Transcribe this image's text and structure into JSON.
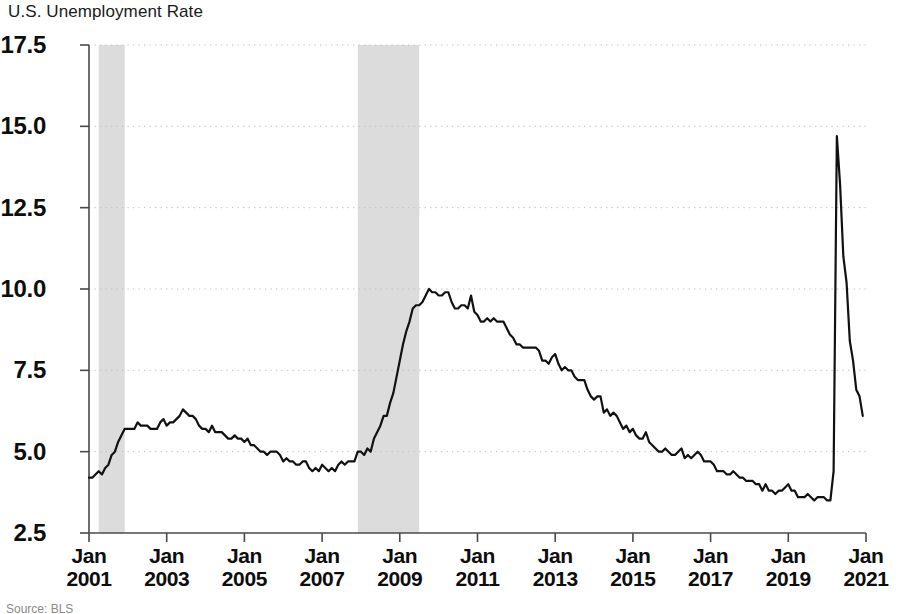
{
  "chart_data": {
    "type": "line",
    "title": "U.S. Unemployment Rate",
    "xlabel": "",
    "ylabel": "",
    "ylim": [
      2.5,
      17.5
    ],
    "yticks": [
      "2.5",
      "5.0",
      "7.5",
      "10.0",
      "12.5",
      "15.0",
      "17.5"
    ],
    "ytick_values": [
      2.5,
      5.0,
      7.5,
      10.0,
      12.5,
      15.0,
      17.5
    ],
    "xticks": [
      {
        "month": "Jan",
        "year": "2001"
      },
      {
        "month": "Jan",
        "year": "2003"
      },
      {
        "month": "Jan",
        "year": "2005"
      },
      {
        "month": "Jan",
        "year": "2007"
      },
      {
        "month": "Jan",
        "year": "2009"
      },
      {
        "month": "Jan",
        "year": "2011"
      },
      {
        "month": "Jan",
        "year": "2013"
      },
      {
        "month": "Jan",
        "year": "2015"
      },
      {
        "month": "Jan",
        "year": "2017"
      },
      {
        "month": "Jan",
        "year": "2019"
      },
      {
        "month": "Jan",
        "year": "2021"
      }
    ],
    "xtick_values": [
      2001,
      2003,
      2005,
      2007,
      2009,
      2011,
      2013,
      2015,
      2017,
      2019,
      2021
    ],
    "xlim": [
      2001.0,
      2021.0
    ],
    "grid": true,
    "grid_style": "dotted-horizontal",
    "legend": null,
    "line_color": "#111111",
    "line_width": 2.2,
    "shaded_regions": [
      {
        "label": "recession",
        "x0": 2001.25,
        "x1": 2001.92,
        "color": "#dcdcdc"
      },
      {
        "label": "recession",
        "x0": 2007.92,
        "x1": 2009.5,
        "color": "#dcdcdc"
      }
    ],
    "x_start": 2001.0,
    "x_step": 0.0833333,
    "values": [
      4.2,
      4.2,
      4.3,
      4.4,
      4.3,
      4.5,
      4.6,
      4.9,
      5.0,
      5.3,
      5.5,
      5.7,
      5.7,
      5.7,
      5.7,
      5.9,
      5.8,
      5.8,
      5.8,
      5.7,
      5.7,
      5.7,
      5.9,
      6.0,
      5.8,
      5.9,
      5.9,
      6.0,
      6.1,
      6.3,
      6.2,
      6.1,
      6.1,
      6.0,
      5.8,
      5.7,
      5.7,
      5.6,
      5.8,
      5.6,
      5.6,
      5.6,
      5.5,
      5.4,
      5.4,
      5.5,
      5.4,
      5.4,
      5.3,
      5.4,
      5.2,
      5.2,
      5.1,
      5.0,
      5.0,
      4.9,
      5.0,
      5.0,
      5.0,
      4.9,
      4.7,
      4.8,
      4.7,
      4.7,
      4.6,
      4.6,
      4.7,
      4.7,
      4.5,
      4.4,
      4.5,
      4.4,
      4.6,
      4.5,
      4.4,
      4.5,
      4.4,
      4.6,
      4.7,
      4.6,
      4.7,
      4.7,
      4.7,
      5.0,
      5.0,
      4.9,
      5.1,
      5.0,
      5.4,
      5.6,
      5.8,
      6.1,
      6.1,
      6.5,
      6.8,
      7.3,
      7.8,
      8.3,
      8.7,
      9.0,
      9.4,
      9.5,
      9.5,
      9.6,
      9.8,
      10.0,
      9.9,
      9.9,
      9.8,
      9.8,
      9.9,
      9.9,
      9.6,
      9.4,
      9.4,
      9.5,
      9.5,
      9.4,
      9.8,
      9.3,
      9.2,
      9.0,
      9.0,
      9.1,
      9.0,
      9.1,
      9.0,
      9.0,
      9.0,
      8.8,
      8.6,
      8.5,
      8.3,
      8.3,
      8.2,
      8.2,
      8.2,
      8.2,
      8.2,
      8.1,
      7.8,
      7.8,
      7.7,
      7.9,
      8.0,
      7.7,
      7.5,
      7.6,
      7.5,
      7.5,
      7.3,
      7.2,
      7.2,
      7.2,
      6.9,
      6.7,
      6.6,
      6.7,
      6.7,
      6.2,
      6.3,
      6.1,
      6.2,
      6.1,
      5.9,
      5.7,
      5.8,
      5.6,
      5.7,
      5.5,
      5.4,
      5.4,
      5.6,
      5.3,
      5.2,
      5.1,
      5.0,
      5.0,
      5.1,
      5.0,
      4.9,
      4.9,
      5.0,
      5.1,
      4.8,
      4.9,
      4.8,
      4.9,
      5.0,
      4.9,
      4.7,
      4.7,
      4.7,
      4.6,
      4.4,
      4.4,
      4.4,
      4.3,
      4.3,
      4.4,
      4.3,
      4.2,
      4.2,
      4.1,
      4.1,
      4.1,
      4.0,
      4.0,
      3.8,
      4.0,
      3.8,
      3.8,
      3.7,
      3.8,
      3.8,
      3.9,
      4.0,
      3.8,
      3.8,
      3.6,
      3.6,
      3.6,
      3.7,
      3.6,
      3.5,
      3.6,
      3.6,
      3.6,
      3.5,
      3.5,
      4.4,
      14.7,
      13.2,
      11.0,
      10.2,
      8.4,
      7.8,
      6.9,
      6.7,
      6.1
    ]
  },
  "footnote": "Source: BLS"
}
